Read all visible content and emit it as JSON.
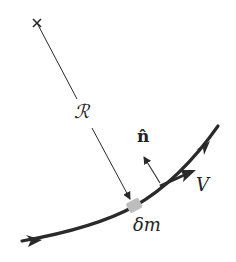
{
  "diagram": {
    "labels": {
      "radius": "ℛ",
      "normal": "n̂",
      "velocity": "V",
      "mass_element": "δm"
    },
    "colors": {
      "stroke": "#2a2a2a",
      "mass_element": "#bdbdbd",
      "background": "#ffffff"
    }
  }
}
